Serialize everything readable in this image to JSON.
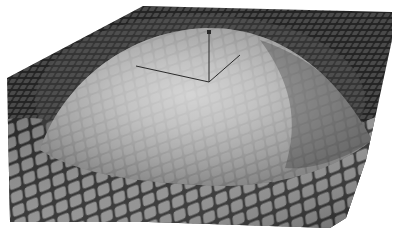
{
  "image": {
    "kind": "3d-rendered-surface",
    "subject": "tiled mesh surface with central dome bump",
    "colors": {
      "background": "#ffffff",
      "flat_tiles": "#3c3c3c",
      "tile_gap": "#1e1e1e",
      "dome_highlight": "#e6e6e6",
      "dome_mid": "#a8a8a8",
      "near_tiles": "#8a8a8a",
      "wire_lines": "#2a2a2a"
    },
    "overlay": {
      "name": "axis-triad-wireframe",
      "lines": 3
    }
  }
}
